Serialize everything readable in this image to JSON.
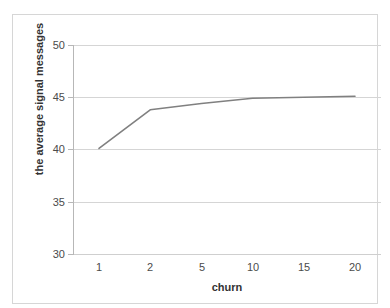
{
  "chart_data": {
    "type": "line",
    "title": "",
    "xlabel": "churn",
    "ylabel": "the average signal messages",
    "categories": [
      "1",
      "2",
      "5",
      "10",
      "15",
      "20"
    ],
    "series": [
      {
        "name": "the average signal messages",
        "color": "#808080",
        "values": [
          40.1,
          43.8,
          44.4,
          44.9,
          45.0,
          45.1
        ]
      }
    ],
    "ylim": [
      30,
      50
    ],
    "yticks": [
      50,
      45,
      40,
      35,
      30
    ],
    "ytick_labels": [
      "50",
      "45",
      "40",
      "35",
      "30"
    ],
    "grid": "horizontal",
    "legend": "none",
    "plot_background": "#ffffff",
    "gridline_color": "#d5d5d5",
    "axis_color": "#b7b7b7",
    "tick_label_color": "#4b4b4b",
    "axis_title_color": "#333333",
    "frame_border_color": "#d6d6d6"
  },
  "caption_remnant": ""
}
